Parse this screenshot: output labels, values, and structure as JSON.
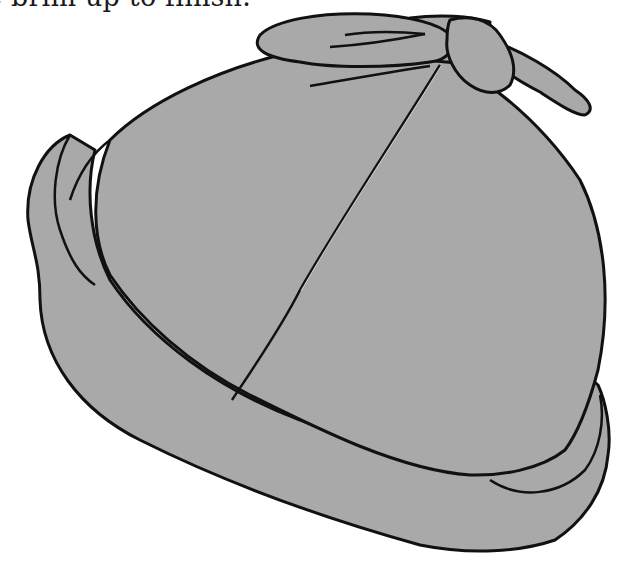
{
  "page": {
    "caption": "e brim up to finish."
  },
  "illustration": {
    "subject": "hat-with-bow",
    "fill_color": "#a9a9a9",
    "outline_color": "#111111",
    "seam_color": "#ffffff"
  }
}
